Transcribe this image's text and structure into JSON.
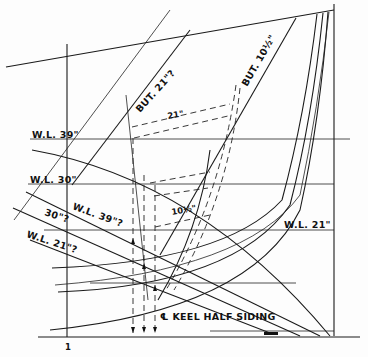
{
  "diagram": {
    "type": "boat lofting half-breadth / body section construction",
    "labels": {
      "wl39": "W.L. 39\"",
      "wl30": "W.L. 30\"",
      "wl21": "W.L. 21\"",
      "wl39_diag": "W.L. 39\"?",
      "wl30_diag": "30\"?",
      "wl21_diag": "W.L. 21\"?",
      "but21": "BUT. 21\"?",
      "but10": "BUT. 10½\"",
      "dim21": "21\"",
      "dim10": "10½\"",
      "keel": "℄ KEEL HALF SIDING",
      "tick1": "1"
    }
  }
}
